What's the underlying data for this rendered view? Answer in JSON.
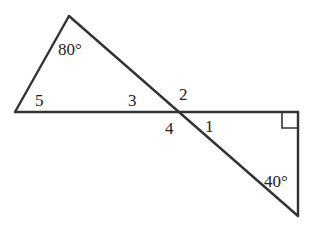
{
  "diagram": {
    "type": "geometry-two-triangles-vertical-angles",
    "stroke_color": "#333333",
    "background": "#ffffff",
    "labels": {
      "angle_top": "80°",
      "angle_bottom_right": "40°",
      "angle_5": "5",
      "angle_3": "3",
      "angle_2": "2",
      "angle_4": "4",
      "angle_1": "1"
    },
    "right_angle_marker": true
  }
}
